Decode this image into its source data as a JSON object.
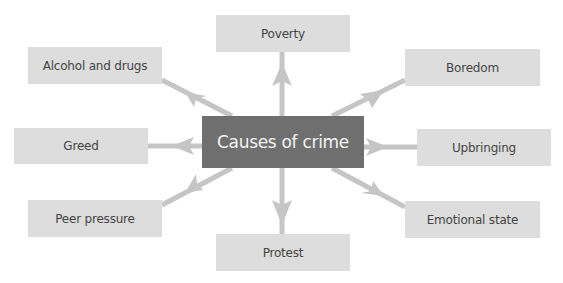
{
  "diagram": {
    "type": "mind-map",
    "center": {
      "label": "Causes of crime",
      "color": "#6f6f6f"
    },
    "node_color": "#dddddd",
    "arrow_color": "#c5c5c5",
    "nodes": [
      {
        "label": "Poverty",
        "position": "top"
      },
      {
        "label": "Boredom",
        "position": "top-right"
      },
      {
        "label": "Upbringing",
        "position": "right"
      },
      {
        "label": "Emotional state",
        "position": "bottom-right"
      },
      {
        "label": "Protest",
        "position": "bottom"
      },
      {
        "label": "Peer pressure",
        "position": "bottom-left"
      },
      {
        "label": "Greed",
        "position": "left"
      },
      {
        "label": "Alcohol and drugs",
        "position": "top-left"
      }
    ]
  }
}
